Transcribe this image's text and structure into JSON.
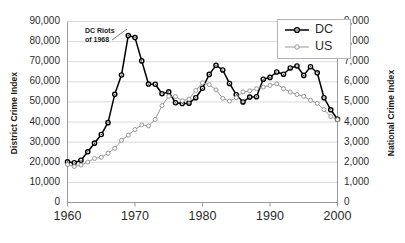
{
  "chart_data": {
    "type": "line",
    "title": "",
    "subtitle": "",
    "xlabel": "",
    "ylabel": "District Crime Index",
    "ylabel_right": "National Crime Index",
    "grid": true,
    "legend_position": "top-right",
    "xlim": [
      1960,
      2000
    ],
    "ylim": [
      0,
      90000
    ],
    "ylim_right": [
      0,
      9000
    ],
    "xticks": [
      1960,
      1970,
      1980,
      1990,
      2000
    ],
    "xtick_labels": [
      "1960",
      "1970",
      "1980",
      "1990",
      "2000"
    ],
    "yticks": [
      0,
      10000,
      20000,
      30000,
      40000,
      50000,
      60000,
      70000,
      80000,
      90000
    ],
    "ytick_labels": [
      "0",
      "10,000",
      "20,000",
      "30,000",
      "40,000",
      "50,000",
      "60,000",
      "70,000",
      "80,000",
      "90,000"
    ],
    "yticks_right": [
      0,
      1000,
      2000,
      3000,
      4000,
      5000,
      6000,
      7000,
      8000,
      9000
    ],
    "ytick_labels_right": [
      "0",
      "1,000",
      "2,000",
      "3,000",
      "4,000",
      "5,000",
      "6,000",
      "7,000",
      "8,000",
      "9,000"
    ],
    "annotations": [
      {
        "name": "dc-riots-annotation",
        "line1": "DC Riots",
        "line2": "of 1968",
        "points_to_year": 1968
      }
    ],
    "x": [
      1960,
      1961,
      1962,
      1963,
      1964,
      1965,
      1966,
      1967,
      1968,
      1969,
      1970,
      1971,
      1972,
      1973,
      1974,
      1975,
      1976,
      1977,
      1978,
      1979,
      1980,
      1981,
      1982,
      1983,
      1984,
      1985,
      1986,
      1987,
      1988,
      1989,
      1990,
      1991,
      1992,
      1993,
      1994,
      1995,
      1996,
      1997,
      1998,
      1999,
      2000
    ],
    "series": [
      {
        "name": "DC",
        "axis": "left",
        "color": "#000000",
        "marker": "circle-filled-center",
        "values": [
          20200,
          19800,
          21000,
          25200,
          29500,
          33800,
          39700,
          53800,
          63400,
          83000,
          82000,
          70400,
          58900,
          58800,
          54100,
          55000,
          49600,
          49200,
          49400,
          52100,
          56800,
          63700,
          68200,
          65900,
          59200,
          53600,
          50000,
          52400,
          52600,
          61300,
          62200,
          64900,
          63800,
          66900,
          67900,
          63200,
          67500,
          64500,
          52100,
          46100,
          41400
        ]
      },
      {
        "name": "US",
        "axis": "right",
        "color": "#8c8c8c",
        "marker": "circle-open",
        "values": [
          1890,
          1790,
          1860,
          2010,
          2190,
          2250,
          2450,
          2690,
          3090,
          3350,
          3630,
          3860,
          3810,
          4130,
          4820,
          5280,
          5270,
          5060,
          5140,
          5570,
          5950,
          5860,
          5600,
          5180,
          5040,
          5210,
          5500,
          5550,
          5660,
          5740,
          5820,
          5900,
          5660,
          5490,
          5370,
          5280,
          5080,
          4930,
          4620,
          4270,
          4120
        ]
      }
    ]
  },
  "axes": {
    "left_title": "District Crime Index",
    "right_title": "National Crime Index"
  },
  "legend": {
    "entries": [
      {
        "label": "DC"
      },
      {
        "label": "US"
      }
    ]
  },
  "colors": {
    "dc_line": "#000000",
    "us_line": "#8c8c8c",
    "gridline": "#d9d9d9",
    "axis": "#9b9b9b",
    "text": "#2b2b2b"
  }
}
